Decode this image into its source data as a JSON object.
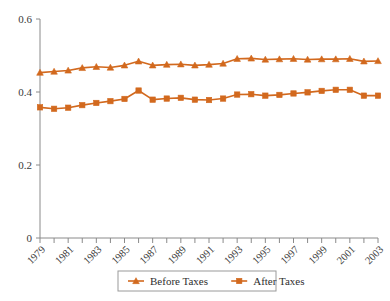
{
  "chart_data": {
    "type": "line",
    "title": "",
    "xlabel": "",
    "ylabel": "",
    "ylim": [
      0,
      0.6
    ],
    "xlim": [
      1979,
      2003
    ],
    "grid": false,
    "legend_position": "bottom",
    "y_ticks": [
      "0",
      "0.2",
      "0.4",
      "0.6"
    ],
    "y_tick_values": [
      0,
      0.2,
      0.4,
      0.6
    ],
    "x_ticks": [
      "1979",
      "1981",
      "1983",
      "1985",
      "1987",
      "1989",
      "1991",
      "1993",
      "1995",
      "1997",
      "1999",
      "2001",
      "2003"
    ],
    "x": [
      1979,
      1980,
      1981,
      1982,
      1983,
      1984,
      1985,
      1986,
      1987,
      1988,
      1989,
      1990,
      1991,
      1992,
      1993,
      1994,
      1995,
      1996,
      1997,
      1998,
      1999,
      2000,
      2001,
      2002,
      2003
    ],
    "series": [
      {
        "name": "Before Taxes",
        "marker": "triangle",
        "color": "#D2691E",
        "values": [
          0.453,
          0.456,
          0.459,
          0.466,
          0.469,
          0.467,
          0.473,
          0.484,
          0.473,
          0.475,
          0.476,
          0.473,
          0.475,
          0.478,
          0.491,
          0.492,
          0.489,
          0.49,
          0.491,
          0.489,
          0.49,
          0.49,
          0.491,
          0.484,
          0.485
        ]
      },
      {
        "name": "After Taxes",
        "marker": "square",
        "color": "#D2691E",
        "values": [
          0.358,
          0.354,
          0.357,
          0.364,
          0.37,
          0.375,
          0.381,
          0.404,
          0.379,
          0.382,
          0.384,
          0.379,
          0.378,
          0.382,
          0.393,
          0.394,
          0.39,
          0.392,
          0.396,
          0.399,
          0.403,
          0.406,
          0.406,
          0.39,
          0.39
        ]
      }
    ]
  },
  "legend": {
    "items": [
      {
        "label": "Before Taxes",
        "marker": "triangle",
        "color": "#D2691E"
      },
      {
        "label": "After Taxes",
        "marker": "square",
        "color": "#D2691E"
      }
    ]
  },
  "colors": {
    "series": "#D2691E",
    "axis": "#8a8a8a",
    "text": "#3a3a3a",
    "background": "#ffffff"
  }
}
